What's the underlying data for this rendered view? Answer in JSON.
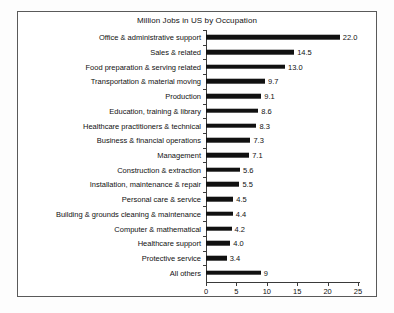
{
  "chart_data": {
    "type": "bar",
    "orientation": "horizontal",
    "title": "Million Jobs in US by Occupation",
    "xlabel": "",
    "ylabel": "",
    "xlim": [
      0,
      25
    ],
    "xticks": [
      0,
      5,
      10,
      15,
      20,
      25
    ],
    "grid": false,
    "legend": null,
    "bar_color": "#111111",
    "categories": [
      "Office & administrative support",
      "Sales & related",
      "Food preparation & serving related",
      "Transportation & material moving",
      "Production",
      "Education, training & library",
      "Healthcare practitioners & technical",
      "Business & financial operations",
      "Management",
      "Construction & extraction",
      "Installation, maintenance & repair",
      "Personal care & service",
      "Building & grounds cleaning & maintenance",
      "Computer & mathematical",
      "Healthcare support",
      "Protective service",
      "All others"
    ],
    "values": [
      22.0,
      14.5,
      13.0,
      9.7,
      9.1,
      8.6,
      8.3,
      7.3,
      7.1,
      5.6,
      5.5,
      4.5,
      4.4,
      4.2,
      4.0,
      3.4,
      9
    ],
    "value_labels": [
      "22.0",
      "14.5",
      "13.0",
      "9.7",
      "9.1",
      "8.6",
      "8.3",
      "7.3",
      "7.1",
      "5.6",
      "5.5",
      "4.5",
      "4.4",
      "4.2",
      "4.0",
      "3.4",
      "9"
    ]
  }
}
